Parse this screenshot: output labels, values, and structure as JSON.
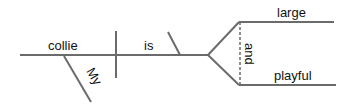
{
  "diagram": {
    "type": "sentence-diagram",
    "sentence_parts": {
      "subject": "collie",
      "subject_modifier": "My",
      "verb": "is",
      "predicate_adjectives": [
        "large",
        "playful"
      ],
      "conjunction": "and"
    },
    "colors": {
      "line": "#6b6b6b",
      "text": "#111111",
      "background": "#ffffff"
    }
  }
}
